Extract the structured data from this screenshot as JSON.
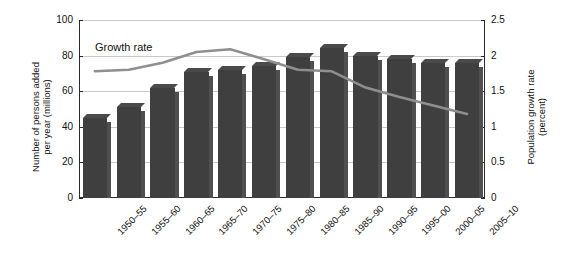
{
  "chart_data": {
    "type": "bar",
    "title": "",
    "subtitle": "",
    "xlabel": "",
    "ylabel": "Number of persons added\nper year (millions)",
    "y2label": "Population growth rate\n(percent)",
    "grid": true,
    "legend_position": "inline-annotation",
    "categories": [
      "1950–55",
      "1955–60",
      "1960–65",
      "1965–70",
      "1970–75",
      "1975–80",
      "1980–85",
      "1985–90",
      "1990–95",
      "1995–00",
      "2000–05",
      "2005–10"
    ],
    "ylim": [
      0,
      100
    ],
    "yticks": [
      "0",
      "20",
      "40",
      "60",
      "80",
      "100"
    ],
    "ytick_values": [
      0,
      20,
      40,
      60,
      80,
      100
    ],
    "y2lim": [
      0,
      2.5
    ],
    "y2ticks": [
      "0",
      "0.5",
      "1",
      "1.5",
      "2",
      "2.5"
    ],
    "y2tick_values": [
      0,
      0.5,
      1,
      1.5,
      2,
      2.5
    ],
    "series": [
      {
        "name": "Number of persons added per year (millions)",
        "type": "bar",
        "axis": "left",
        "color": "#3f3f3f",
        "values": [
          45,
          51,
          62,
          71,
          72,
          74,
          79,
          84,
          80,
          78,
          76,
          76
        ]
      },
      {
        "name": "Growth rate",
        "type": "line",
        "axis": "right",
        "color": "#8f8f8f",
        "values": [
          1.78,
          1.8,
          1.9,
          2.05,
          2.09,
          1.95,
          1.8,
          1.78,
          1.55,
          1.42,
          1.3,
          1.18
        ]
      }
    ],
    "annotations": [
      {
        "text": "Growth rate",
        "target_series": "Growth rate"
      }
    ]
  }
}
